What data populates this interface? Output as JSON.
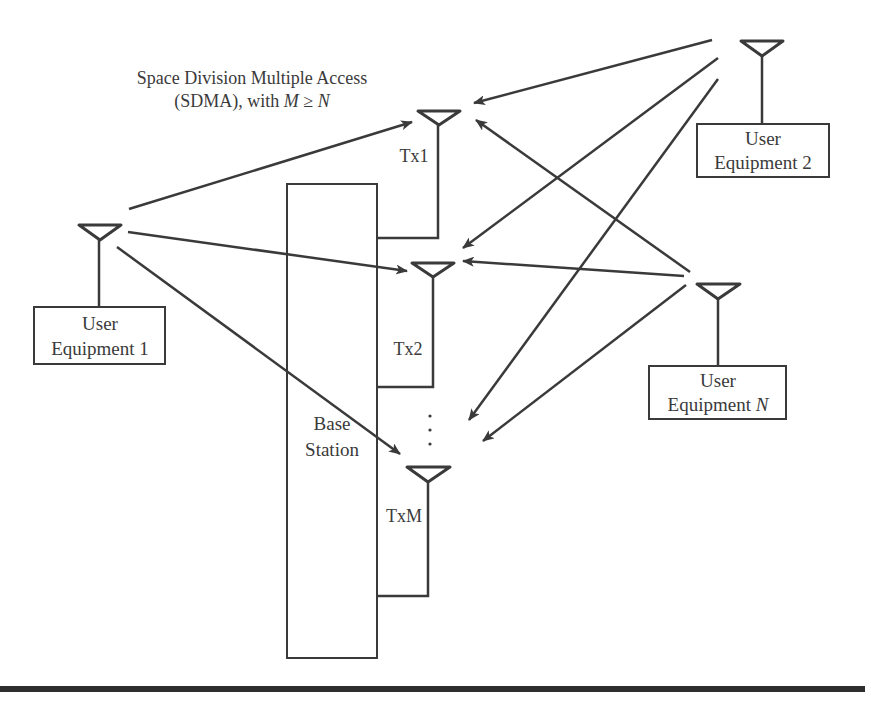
{
  "title": {
    "line1": "Space Division Multiple Access",
    "line2_prefix": "(SDMA), with ",
    "line2_m": "M",
    "line2_op": " ≥ ",
    "line2_n": "N"
  },
  "base_station": {
    "line1": "Base",
    "line2": "Station"
  },
  "transmit_antennas": [
    {
      "label": "Tx1"
    },
    {
      "label": "Tx2"
    },
    {
      "label": "TxM"
    }
  ],
  "ellipsis": "⋮",
  "user_equipment": [
    {
      "line1": "User",
      "line2": "Equipment 1"
    },
    {
      "line1": "User",
      "line2": "Equipment 2"
    },
    {
      "line1": "User",
      "line2_prefix": "Equipment ",
      "line2_var": "N"
    }
  ],
  "colors": {
    "stroke": "#3a3a3a",
    "background": "#ffffff",
    "rule": "#2e2e2e"
  }
}
